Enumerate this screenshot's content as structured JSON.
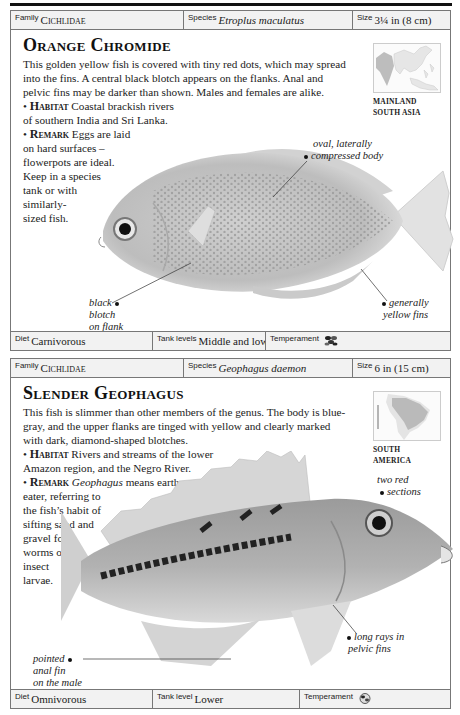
{
  "entries": [
    {
      "family_label": "Family",
      "family": "Cichlidae",
      "species_label": "Species",
      "species": "Etroplus maculatus",
      "size_label": "Size",
      "size": "3¼ in (8 cm)",
      "title": "Orange Chromide",
      "description": "This golden yellow fish is covered with tiny red dots, which may spread into the fins. A central black blotch appears on the flanks. Anal and pelvic fins may be darker than shown. Males and females are alike.",
      "habitat_label": "Habitat",
      "habitat_line1": "Coastal brackish rivers",
      "habitat_line2": "of southern India and Sri Lanka.",
      "remark_label": "Remark",
      "remark_lines": [
        "Eggs are laid",
        "on hard surfaces –",
        "flowerpots are ideal.",
        "Keep in a species",
        "tank or with",
        "similarly-",
        "sized fish."
      ],
      "map_label_line1": "MAINLAND",
      "map_label_line2": "SOUTH ASIA",
      "annotations": {
        "a1_line1": "oval, laterally",
        "a1_line2": "compressed body",
        "a2_line1": "black",
        "a2_line2": "blotch",
        "a2_line3": "on flank",
        "a3_line1": "generally",
        "a3_line2": "yellow fins"
      },
      "diet_label": "Diet",
      "diet": "Carnivorous",
      "tank_label": "Tank levels",
      "tank": "Middle and lower",
      "temperament_label": "Temperament",
      "temperament_icon": "fish-group-icon"
    },
    {
      "family_label": "Family",
      "family": "Cichlidae",
      "species_label": "Species",
      "species": "Geophagus daemon",
      "size_label": "Size",
      "size": "6 in (15 cm)",
      "title": "Slender Geophagus",
      "description": "This fish is slimmer than other members of the genus. The body is blue-gray, and the upper flanks are tinged with yellow and clearly marked with dark, diamond-shaped blotches.",
      "habitat_label": "Habitat",
      "habitat_line1": "Rivers and streams of the lower",
      "habitat_line2": "Amazon region, and the Negro River.",
      "remark_label": "Remark",
      "remark_italic": "Geophagus",
      "remark_first": " means earth-",
      "remark_lines": [
        "eater, referring to",
        "the fish’s habit of",
        "sifting sand and",
        "gravel for",
        "worms or",
        "insect",
        "larvae."
      ],
      "map_label_line1": "SOUTH",
      "map_label_line2": "AMERICA",
      "annotations": {
        "a1_line1": "two red",
        "a1_line2": "sections",
        "a2_line1": "pointed",
        "a2_line2": "anal fin",
        "a2_line3": "on the male",
        "a3_line1": "long rays in",
        "a3_line2": "pelvic fins"
      },
      "diet_label": "Diet",
      "diet": "Omnivorous",
      "tank_label": "Tank level",
      "tank": "Lower",
      "temperament_label": "Temperament",
      "temperament_icon": "single-fish-icon"
    }
  ]
}
